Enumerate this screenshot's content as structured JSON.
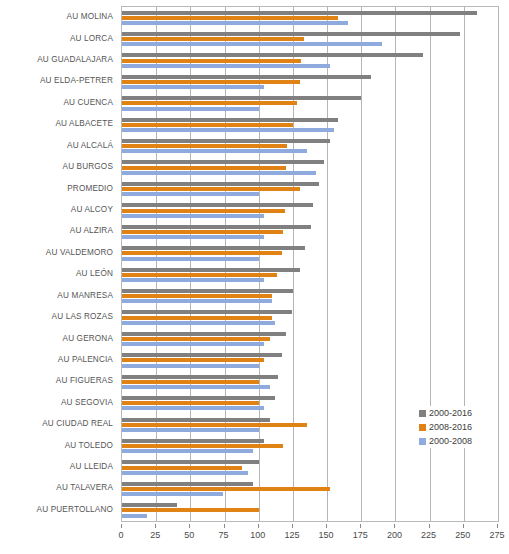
{
  "chart_data": {
    "type": "bar",
    "orientation": "horizontal",
    "title": "",
    "xlabel": "",
    "ylabel": "",
    "xlim": [
      0,
      275
    ],
    "xticks": [
      0,
      25,
      50,
      75,
      100,
      125,
      150,
      175,
      200,
      225,
      250,
      275
    ],
    "grid": true,
    "legend_position": "right-lower",
    "categories": [
      "AU MOLINA",
      "AU LORCA",
      "AU GUADALAJARA",
      "AU ELDA-PETRER",
      "AU CUENCA",
      "AU ALBACETE",
      "AU ALCALÁ",
      "AU BURGOS",
      "PROMEDIO",
      "AU ALCOY",
      "AU ALZIRA",
      "AU VALDEMORO",
      "AU LEÓN",
      "AU MANRESA",
      "AU LAS ROZAS",
      "AU GERONA",
      "AU PALENCIA",
      "AU FIGUERAS",
      "AU SEGOVIA",
      "AU CIUDAD REAL",
      "AU TOLEDO",
      "AU LLEIDA",
      "AU TALAVERA",
      "AU PUERTOLLANO"
    ],
    "series": [
      {
        "name": "2000-2016",
        "color": "#808080",
        "values": [
          260,
          247,
          220,
          182,
          175,
          158,
          152,
          148,
          144,
          140,
          138,
          134,
          130,
          125,
          124,
          120,
          117,
          114,
          112,
          108,
          104,
          100,
          96,
          40
        ]
      },
      {
        "name": "2008-2016",
        "color": "#e08214",
        "values": [
          158,
          133,
          131,
          130,
          128,
          125,
          121,
          120,
          130,
          119,
          118,
          117,
          113,
          110,
          110,
          108,
          104,
          100,
          100,
          135,
          118,
          88,
          152,
          100
        ]
      },
      {
        "name": "2000-2008",
        "color": "#8faadc",
        "values": [
          165,
          190,
          152,
          104,
          100,
          155,
          135,
          142,
          100,
          104,
          104,
          100,
          104,
          110,
          112,
          104,
          100,
          108,
          104,
          100,
          96,
          92,
          74,
          18
        ]
      }
    ]
  },
  "legend": {
    "items": [
      {
        "label": "2000-2016",
        "swatch": "s0"
      },
      {
        "label": "2008-2016",
        "swatch": "s1"
      },
      {
        "label": "2000-2008",
        "swatch": "s2"
      }
    ]
  }
}
